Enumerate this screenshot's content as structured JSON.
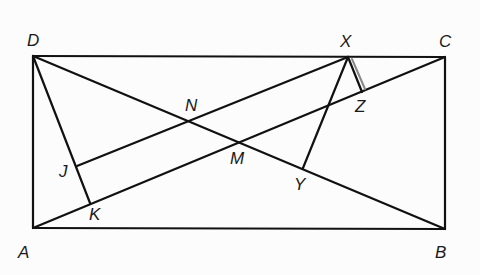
{
  "diagram": {
    "type": "geometry",
    "shape": "rectangle ABCD with diagonals and perpendiculars",
    "colors": {
      "stroke": "#111111",
      "background": "#fcfcfc",
      "highlight": "#777777"
    },
    "points": {
      "A": {
        "label": "A",
        "x": 33,
        "y": 228,
        "lx": 18,
        "ly": 258
      },
      "B": {
        "label": "B",
        "x": 445,
        "y": 229,
        "lx": 435,
        "ly": 258
      },
      "C": {
        "label": "C",
        "x": 445,
        "y": 57,
        "lx": 439,
        "ly": 47
      },
      "D": {
        "label": "D",
        "x": 33,
        "y": 56,
        "lx": 27,
        "ly": 46
      },
      "X": {
        "label": "X",
        "x": 348,
        "y": 57,
        "lx": 340,
        "ly": 47
      },
      "N": {
        "label": "N",
        "x": 192,
        "y": 121,
        "lx": 185,
        "ly": 111
      },
      "M": {
        "label": "M",
        "x": 239,
        "y": 142,
        "lx": 230,
        "ly": 164
      },
      "J": {
        "label": "J",
        "x": 77,
        "y": 166,
        "lx": 59,
        "ly": 177
      },
      "K": {
        "label": "K",
        "x": 90,
        "y": 203,
        "lx": 89,
        "ly": 220
      },
      "Y": {
        "label": "Y",
        "x": 303,
        "y": 168,
        "lx": 294,
        "ly": 190
      },
      "Z": {
        "label": "Z",
        "x": 362,
        "y": 92,
        "lx": 355,
        "ly": 112
      }
    },
    "segments": [
      [
        "A",
        "B"
      ],
      [
        "B",
        "C"
      ],
      [
        "C",
        "D"
      ],
      [
        "D",
        "A"
      ],
      [
        "A",
        "C"
      ],
      [
        "D",
        "B"
      ],
      [
        "D",
        "K"
      ],
      [
        "J",
        "X"
      ],
      [
        "X",
        "Y"
      ],
      [
        "X",
        "Z"
      ]
    ]
  }
}
